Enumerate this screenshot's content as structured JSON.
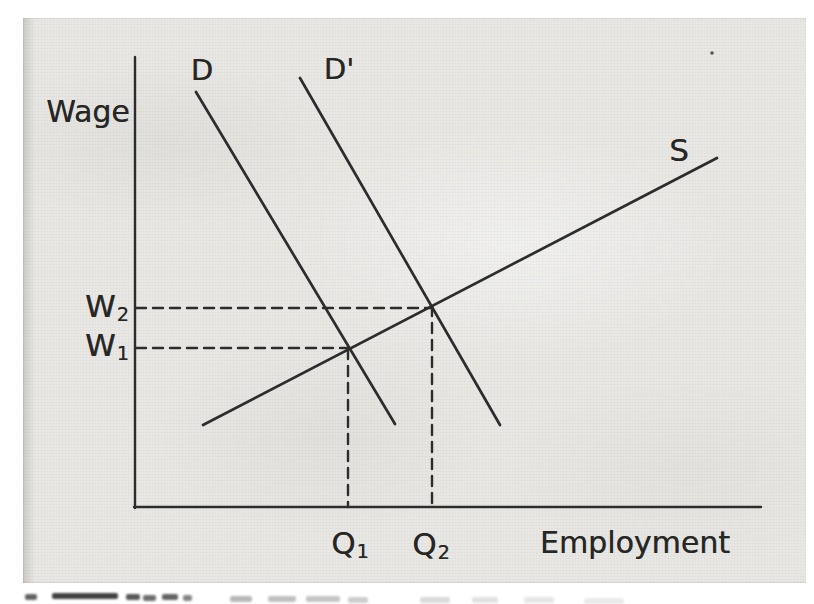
{
  "figure": {
    "ink_color": "#2c2c2c",
    "paper_color": "#e9e8e5",
    "y_axis_label": "Wage",
    "x_axis_label": "Employment",
    "labels": {
      "demand": "D",
      "demand_shifted": "D'",
      "supply": "S",
      "w1": {
        "base": "W",
        "sub": "1"
      },
      "w2": {
        "base": "W",
        "sub": "2"
      },
      "q1": {
        "base": "Q",
        "sub": "1"
      },
      "q2": {
        "base": "Q",
        "sub": "2"
      }
    },
    "artifacts": {
      "speck_px": [
        689,
        35
      ],
      "caption_fragments": [
        [
          25,
          594,
          12,
          0.7
        ],
        [
          52,
          593,
          66,
          0.85
        ],
        [
          126,
          594,
          14,
          0.75
        ],
        [
          143,
          595,
          13,
          0.65
        ],
        [
          162,
          594,
          16,
          0.7
        ],
        [
          183,
          595,
          9,
          0.55
        ],
        [
          230,
          596,
          22,
          0.32
        ],
        [
          268,
          596,
          28,
          0.28
        ],
        [
          306,
          596,
          34,
          0.26
        ],
        [
          348,
          597,
          20,
          0.22
        ],
        [
          420,
          597,
          30,
          0.16
        ],
        [
          472,
          597,
          26,
          0.13
        ],
        [
          524,
          597,
          30,
          0.11
        ],
        [
          584,
          598,
          40,
          0.09
        ]
      ]
    }
  },
  "chart_data": {
    "type": "line",
    "subtype": "supply-demand-diagram",
    "xlabel": "Employment",
    "ylabel": "Wage",
    "axes_numeric": false,
    "grid": false,
    "axes_px": [
      {
        "name": "y-axis",
        "points": [
          [
            112,
            39
          ],
          [
            112,
            490
          ]
        ]
      },
      {
        "name": "x-axis",
        "points": [
          [
            111,
            489
          ],
          [
            738,
            489
          ]
        ]
      }
    ],
    "series": [
      {
        "id": "demand",
        "name": "D",
        "slope": "negative",
        "points_px": [
          [
            173,
            74
          ],
          [
            372,
            406
          ]
        ]
      },
      {
        "id": "demand-shifted",
        "name": "D'",
        "slope": "negative",
        "points_px": [
          [
            277,
            60
          ],
          [
            477,
            407
          ]
        ]
      },
      {
        "id": "supply",
        "name": "S",
        "slope": "positive",
        "points_px": [
          [
            180,
            407
          ],
          [
            694,
            140
          ]
        ]
      }
    ],
    "equilibria": [
      {
        "wage": "W1",
        "employment": "Q1",
        "point_px": [
          325,
          331
        ],
        "curves": [
          "D",
          "S"
        ]
      },
      {
        "wage": "W2",
        "employment": "Q2",
        "point_px": [
          409,
          288
        ],
        "curves": [
          "D'",
          "S"
        ]
      }
    ],
    "guides": [
      {
        "name": "w2-wage-guide",
        "style": "dashed",
        "from_px": [
          113,
          290
        ],
        "to_px": [
          409,
          290
        ]
      },
      {
        "name": "w1-wage-guide",
        "style": "dashed",
        "from_px": [
          113,
          330
        ],
        "to_px": [
          325,
          330
        ]
      },
      {
        "name": "q1-employment-guide",
        "style": "dashed",
        "from_px": [
          325,
          331
        ],
        "to_px": [
          325,
          489
        ]
      },
      {
        "name": "q2-employment-guide",
        "style": "dashed",
        "from_px": [
          409,
          288
        ],
        "to_px": [
          409,
          489
        ]
      }
    ]
  }
}
